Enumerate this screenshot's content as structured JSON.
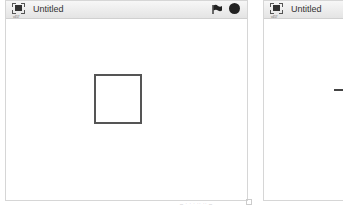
{
  "windows": [
    {
      "title": "Untitled",
      "version": "v457",
      "has_controls": true,
      "sprite": "square"
    },
    {
      "title": "Untitled",
      "version": "v457",
      "has_controls": false,
      "sprite": "line"
    }
  ],
  "controls": {
    "flag": "green-flag-icon",
    "stop": "stop-icon"
  },
  "statusbar": {
    "text": "— · · · ·· ·· —"
  }
}
